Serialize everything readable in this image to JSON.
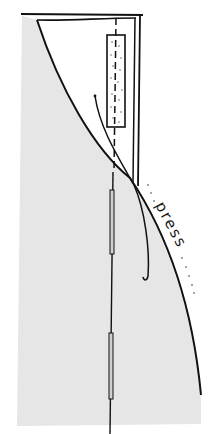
{
  "diagram": {
    "type": "sewing-illustration",
    "annotation": {
      "label": "press",
      "leading_dots": "· · ·",
      "trailing_dots": "· · · ·"
    },
    "colors": {
      "background": "#ffffff",
      "fabric_shade": "#e6e6e6",
      "line": "#111111"
    },
    "parts": [
      "fabric-panel",
      "folded-edge-curve",
      "top-edge",
      "double-right-edge",
      "interfacing-strip",
      "center-dash-line",
      "thread-tail",
      "seam-line",
      "seam-slot-upper",
      "seam-slot-lower"
    ]
  }
}
